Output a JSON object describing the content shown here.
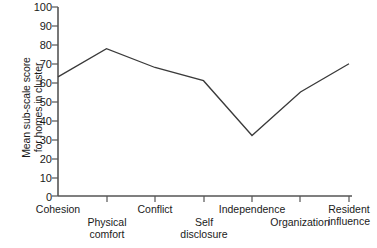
{
  "chart_data": {
    "type": "line",
    "title": "",
    "xlabel": "",
    "ylabel": "Mean sub-scale score\nfor homes in cluster",
    "categories": [
      "Cohesion",
      "Physical\ncomfort",
      "Conflict",
      "Self\ndisclosure",
      "Independence",
      "Organization",
      "Resident\ninfluence"
    ],
    "values": [
      63,
      78,
      68,
      61,
      32,
      55,
      70
    ],
    "ylim": [
      0,
      100
    ],
    "yticks": [
      0,
      10,
      20,
      30,
      40,
      50,
      60,
      70,
      80,
      90,
      100
    ],
    "ytick_labels": [
      "0",
      "10",
      "20",
      "30",
      "40",
      "50",
      "60",
      "70",
      "80",
      "90",
      "100"
    ],
    "grid": false,
    "legend": null,
    "line_color": "#3a3a3a",
    "axis_color": "#555555",
    "markers": false
  },
  "axis": {
    "y_title": "Mean sub-scale score\nfor homes in cluster",
    "tick_0": "0",
    "tick_10": "10",
    "tick_20": "20",
    "tick_30": "30",
    "tick_40": "40",
    "tick_50": "50",
    "tick_60": "60",
    "tick_70": "70",
    "tick_80": "80",
    "tick_90": "90",
    "tick_100": "100"
  },
  "xlabels": {
    "l0": "Cohesion",
    "l1": "Physical\ncomfort",
    "l2": "Conflict",
    "l3": "Self\ndisclosure",
    "l4": "Independence",
    "l5": "Organization",
    "l6": "Resident\ninfluence"
  }
}
